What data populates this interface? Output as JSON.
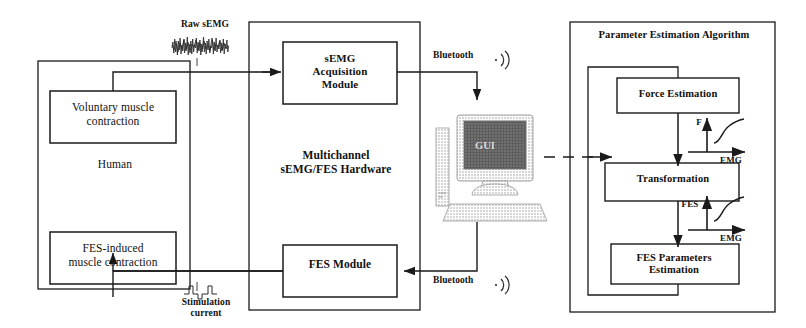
{
  "diagram": {
    "colors": {
      "stroke": "#1a1a1a",
      "text": "#111111",
      "screen_fill": "#585858",
      "case_fill": "#d8d8d8",
      "background": "#ffffff"
    }
  },
  "human_block": {
    "label": "Human",
    "voluntary_box": "Voluntary muscle\ncontraction",
    "fes_box": "FES-induced\nmuscle contraction"
  },
  "signals": {
    "raw_semg_label": "Raw sEMG",
    "stimulation_label": "Stimulation\ncurrent"
  },
  "hardware_block": {
    "label": "Multichannel\nsEMG/FES Hardware",
    "acquisition_box": "sEMG\nAcquisition\nModule",
    "fes_module_box": "FES Module"
  },
  "computer": {
    "screen_label": "GUI",
    "icon_monitor": "monitor-icon",
    "icon_tower": "tower-icon",
    "icon_mouse": "mouse-icon",
    "icon_keyboard": "keyboard-icon"
  },
  "wireless": {
    "uplink_label": "Bluetooth",
    "downlink_label": "Bluetooth",
    "icon": "bluetooth-signal-icon"
  },
  "algorithm_block": {
    "title": "Parameter Estimation Algorithm",
    "force_box": "Force Estimation",
    "transformation_box": "Transformation",
    "fes_parameters_box": "FES Parameters\nEstimation"
  },
  "inset_plots": [
    {
      "name": "force-vs-emg-plot",
      "y_axis_label": "F",
      "x_axis_label": "EMG",
      "curve": "monotonic-saturating"
    },
    {
      "name": "fes-vs-emg-plot",
      "y_axis_label": "FES",
      "x_axis_label": "EMG",
      "curve": "monotonic-saturating"
    }
  ]
}
